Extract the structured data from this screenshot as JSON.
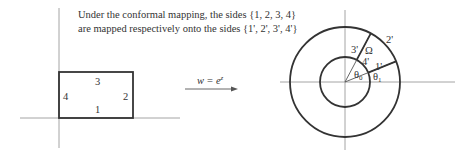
{
  "caption": {
    "line1": "Under the conformal mapping, the sides {1, 2, 3, 4}",
    "line2": "are mapped respectively onto the sides {1', 2', 3', 4'}"
  },
  "left_figure": {
    "description": "rectangle in z-plane",
    "side_labels": {
      "bottom": "1",
      "right": "2",
      "top": "3",
      "left": "4"
    }
  },
  "mapping": {
    "label_w": "w",
    "label_eq": "=",
    "label_base": "e",
    "label_exp": "z"
  },
  "right_figure": {
    "description": "annular sector in w-plane",
    "side_labels": {
      "s1": "1'",
      "s2": "2'",
      "s3": "3'",
      "s4": "4'"
    },
    "region_label": "Ω",
    "angle_labels": {
      "theta0": "θ",
      "theta0_sub": "0",
      "theta1": "θ",
      "theta1_sub": "1"
    }
  }
}
